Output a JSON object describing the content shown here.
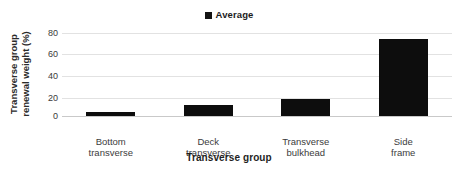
{
  "chart_data": {
    "type": "bar",
    "title": "",
    "categories": [
      "Bottom transverse",
      "Deck transverse",
      "Transverse bulkhead",
      "Side frame"
    ],
    "category_lines": [
      [
        "Bottom",
        "transverse"
      ],
      [
        "Deck",
        "transverse"
      ],
      [
        "Transverse",
        "bulkhead"
      ],
      [
        "Side",
        "frame"
      ]
    ],
    "series": [
      {
        "name": "Average",
        "values": [
          4,
          11,
          16,
          74
        ]
      }
    ],
    "values": [
      4,
      11,
      16,
      74
    ],
    "xlabel": "Transverse group",
    "ylabel": "Transverse group renewal weight (%)",
    "ylim": [
      0,
      80
    ],
    "ytick_values": [
      80,
      60,
      40,
      20,
      0
    ],
    "ytick_labels": [
      "80",
      "60",
      "40",
      "20",
      "0"
    ],
    "grid": true,
    "legend_position": "top-center",
    "bar_color": "#0d0d0d",
    "gridline_color": "#e2e2e2",
    "background_color": "#ffffff"
  },
  "legend": {
    "items": [
      {
        "label": "Average",
        "color": "#141414"
      }
    ]
  },
  "axes": {
    "y_title_line1": "Transverse group",
    "y_title_line2": "renewal weight (%)",
    "x_title": "Transverse group"
  }
}
